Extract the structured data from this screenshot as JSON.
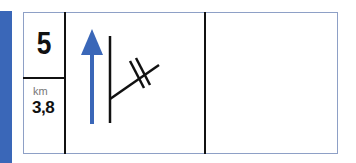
{
  "sign": {
    "exit_number": "5",
    "distance_unit": "km",
    "distance_value": "3,8",
    "symbols": [
      {
        "name": "straight-ahead-arrow",
        "color": "#3a67b8"
      },
      {
        "name": "junction-with-crossing-marks",
        "color": "#111111"
      }
    ],
    "empty_panel": ""
  },
  "colors": {
    "accent_bar": "#3a67b8",
    "frame_border": "#8ea0c6",
    "line": "#111111",
    "unit_text": "#777777"
  }
}
